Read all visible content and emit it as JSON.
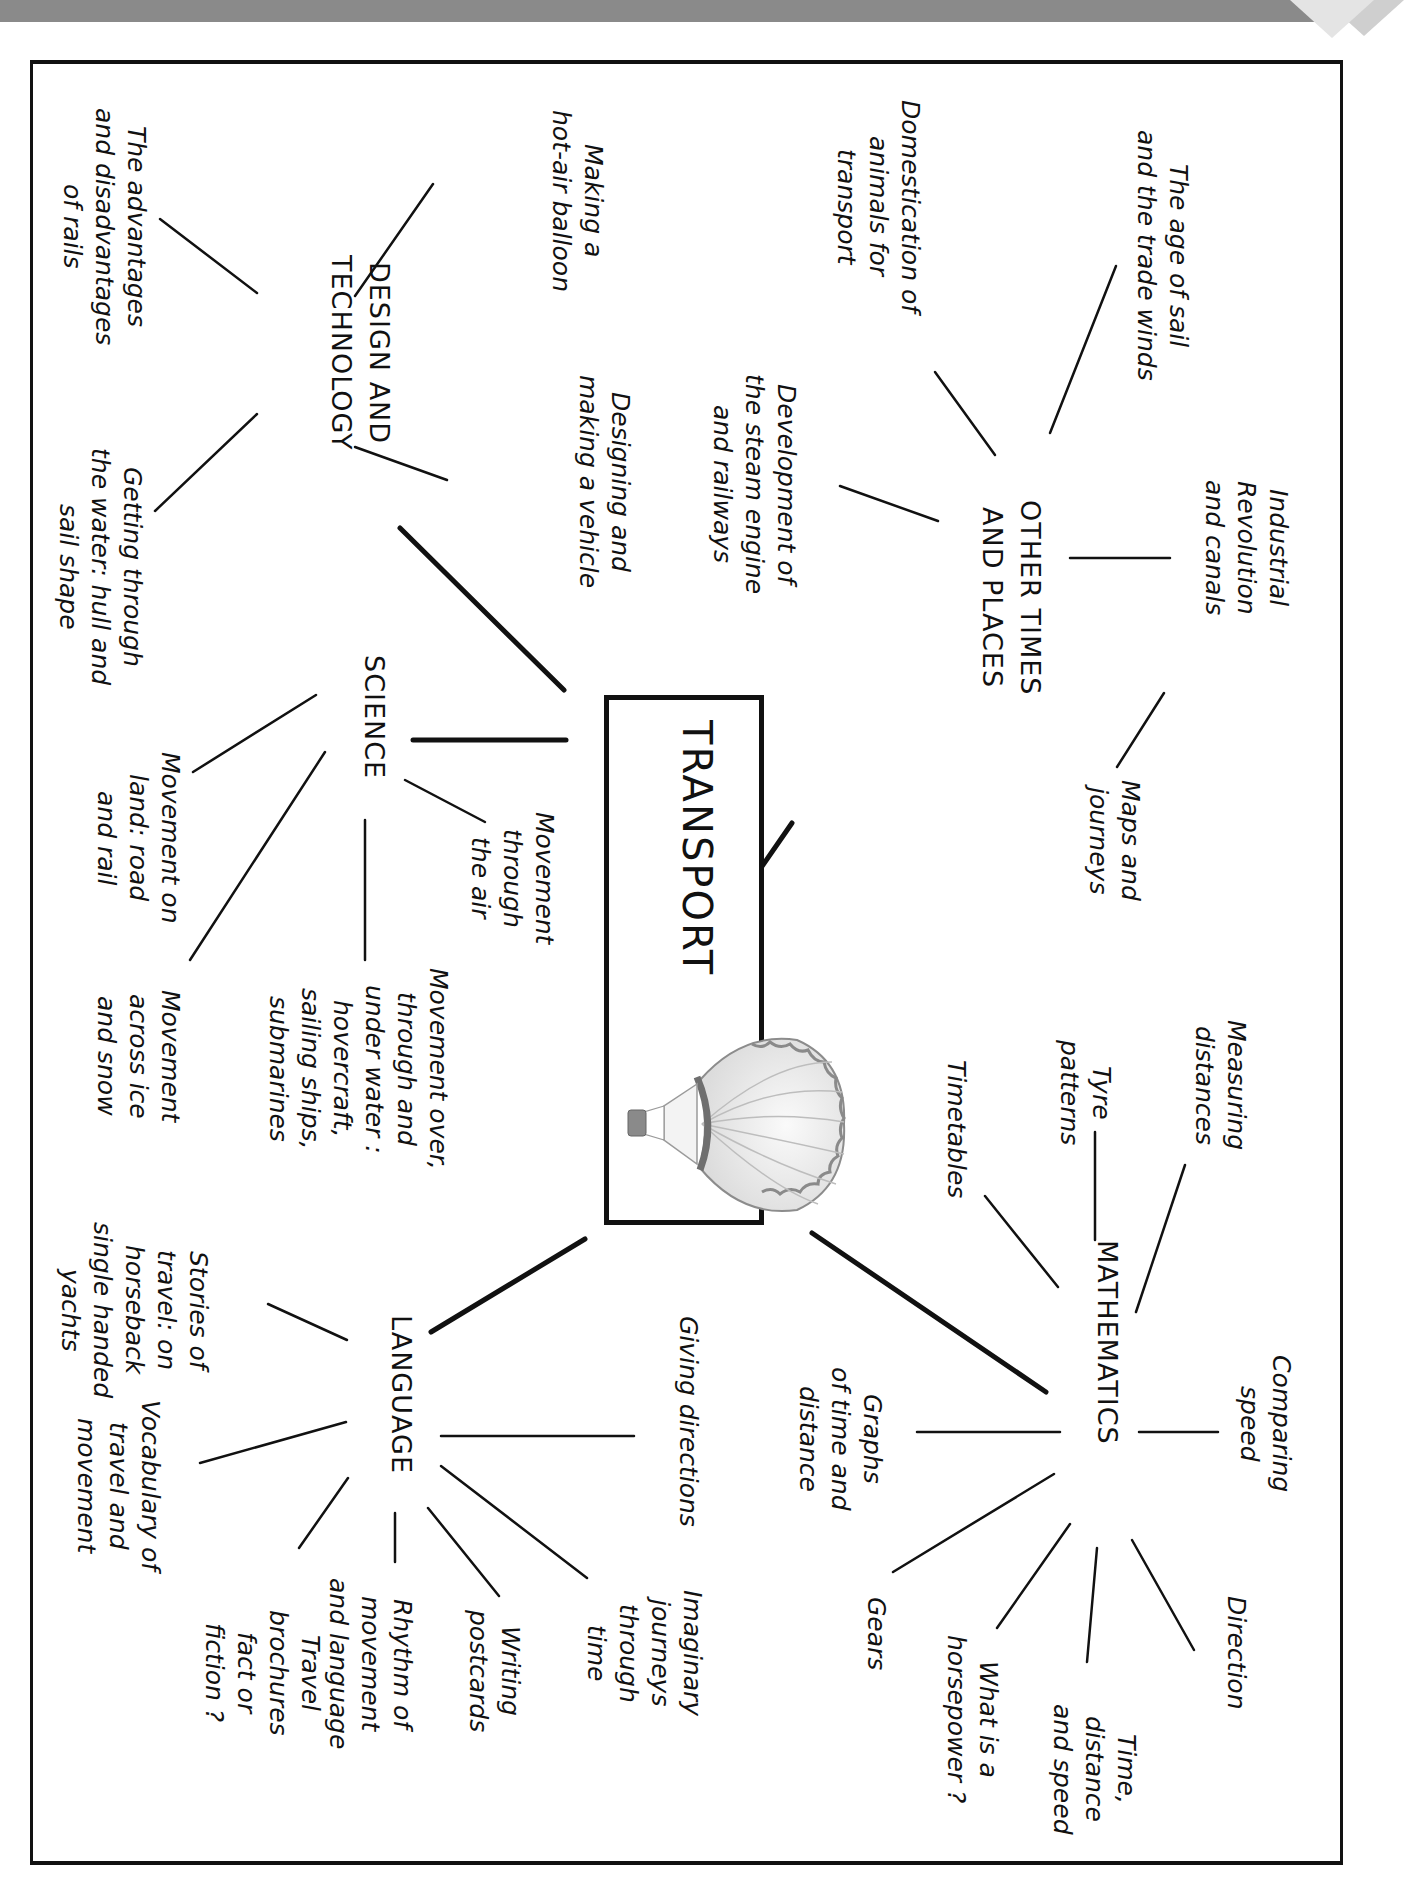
{
  "diagram": {
    "type": "mind-map",
    "orientation": "rotated 90deg clockwise",
    "center": {
      "title": "TRANSPORT",
      "illustration": "hot-air-balloon-icon"
    },
    "branches": [
      {
        "hub": "OTHER TIMES\nAND PLACES",
        "leaves": [
          "The age of sail\nand the trade winds",
          "Industrial\nRevolution\nand canals",
          "Domestication of\nanimals for\ntransport",
          "Development of\nthe steam engine\nand railways",
          "Maps and\njourneys"
        ]
      },
      {
        "hub": "MATHEMATICS",
        "leaves": [
          "Measuring\ndistances",
          "Tyre\npatterns",
          "Timetables",
          "Comparing\nspeed",
          "Graphs\nof time and\ndistance",
          "Direction",
          "Time,\ndistance\nand speed",
          "What is a\nhorsepower ?",
          "Gears"
        ]
      },
      {
        "hub": "LANGUAGE",
        "leaves": [
          "Giving directions",
          "Imaginary\njourneys\nthrough\ntime",
          "Writing\npostcards",
          "Rhythm of\nmovement\nand language",
          "Stories of\ntravel: on\nhorseback\nsingle handed\nyachts",
          "Vocabulary of\ntravel and\nmovement",
          "Travel\nbrochures\nfact or\nfiction ?"
        ]
      },
      {
        "hub": "SCIENCE",
        "leaves": [
          "Movement\nthrough\nthe air",
          "Movement over,\nthrough and\nunder water :\nhovercraft,\nsailing ships,\nsubmarines",
          "Movement on\nland: road\nand rail",
          "Movement\nacross ice\nand snow"
        ]
      },
      {
        "hub": "DESIGN AND\nTECHNOLOGY",
        "leaves": [
          "Making a\nhot-air balloon",
          "Designing and\nmaking a vehicle",
          "The advantages\nand disadvantages\nof rails",
          "Getting through\nthe water: hull and\nsail shape"
        ]
      }
    ]
  },
  "colors": {
    "ink": "#111111",
    "banner": "#8a8a8a",
    "background": "#ffffff"
  }
}
